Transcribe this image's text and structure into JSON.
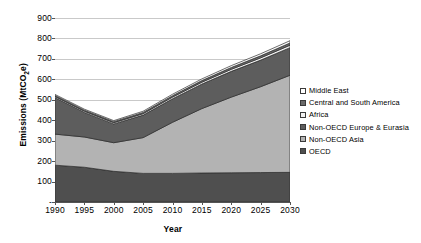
{
  "chart_data": {
    "type": "area",
    "stacked": true,
    "title": "",
    "xlabel": "Year",
    "ylabel": "Emissions (MtCO2e)",
    "ylabel_html": "Emissions (MtCO<sub>2</sub>e)",
    "x": [
      1990,
      1995,
      2000,
      2005,
      2010,
      2015,
      2020,
      2025,
      2030
    ],
    "xlim": [
      1990,
      2030
    ],
    "ylim": [
      0,
      900
    ],
    "yticks": [
      0,
      100,
      200,
      300,
      400,
      500,
      600,
      700,
      800,
      900
    ],
    "ytick_labels": [
      "-",
      "100",
      "200",
      "300",
      "400",
      "500",
      "600",
      "700",
      "800",
      "900"
    ],
    "xtick_labels": [
      "1990",
      "1995",
      "2000",
      "2005",
      "2010",
      "2015",
      "2020",
      "2025",
      "2030"
    ],
    "grid": "horizontal",
    "legend_position": "right",
    "series": [
      {
        "name": "OECD",
        "color": "#4f4f4f",
        "values": [
          180,
          170,
          150,
          140,
          140,
          142,
          143,
          144,
          145
        ]
      },
      {
        "name": "Non-OECD Asia",
        "color": "#b3b3b3",
        "values": [
          152,
          148,
          140,
          175,
          250,
          315,
          370,
          420,
          475
        ]
      },
      {
        "name": "Non-OECD Europe & Eurasia",
        "color": "#5d5d5d",
        "values": [
          178,
          120,
          92,
          110,
          115,
          120,
          126,
          130,
          135
        ]
      },
      {
        "name": "Africa",
        "color": "#f2f2f2",
        "values": [
          6,
          6,
          6,
          7,
          8,
          9,
          10,
          11,
          12
        ]
      },
      {
        "name": "Central and South America",
        "color": "#6a6a6a",
        "values": [
          5,
          5,
          5,
          6,
          7,
          8,
          9,
          10,
          11
        ]
      },
      {
        "name": "Middle East",
        "color": "#ffffff",
        "values": [
          5,
          5,
          5,
          6,
          7,
          8,
          9,
          10,
          11
        ]
      }
    ],
    "stack_totals": [
      526,
      454,
      398,
      444,
      527,
      602,
      667,
      725,
      789
    ],
    "legend_order": [
      "Middle East",
      "Central and South America",
      "Africa",
      "Non-OECD Europe & Eurasia",
      "Non-OECD Asia",
      "OECD"
    ]
  },
  "colors": {
    "gridline": "#c9c9c9",
    "axis": "#555555",
    "background": "#ffffff",
    "text": "#000000"
  }
}
